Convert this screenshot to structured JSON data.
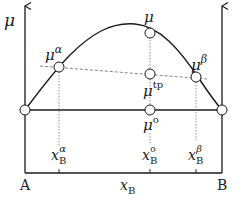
{
  "diagram": {
    "y_axis_label": "μ",
    "x_axis_label": "x",
    "x_axis_label_sub": "B",
    "left_end_label": "A",
    "right_end_label": "B",
    "points": {
      "mu_alpha": {
        "base": "μ",
        "sup": "α"
      },
      "mu": {
        "base": "μ",
        "sup": ""
      },
      "mu_beta": {
        "base": "μ",
        "sup": "β"
      },
      "mu_tp": {
        "base": "μ",
        "sup": "tp"
      },
      "mu_o": {
        "base": "μ",
        "sup": "o"
      }
    },
    "compositions": {
      "xB_alpha": {
        "base": "x",
        "sub": "B",
        "sup": "α"
      },
      "xB_o": {
        "base": "x",
        "sub": "B",
        "sup": "o"
      },
      "xB_beta": {
        "base": "x",
        "sub": "B",
        "sup": "β"
      }
    },
    "colors": {
      "line": "#1a1a1a",
      "guide": "#777777",
      "background": "#ffffff"
    }
  }
}
